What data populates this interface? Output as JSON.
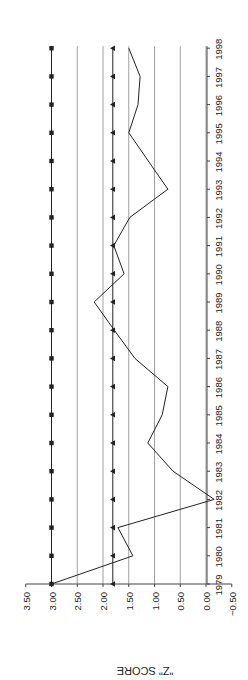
{
  "chart_data": {
    "type": "line",
    "orientation": "rotated-90-counterclockwise",
    "title": "",
    "xlabel": "",
    "ylabel": "\"Z\" SCORE",
    "ylim": [
      -0.5,
      3.5
    ],
    "yticks": [
      "3.50",
      "3.00",
      "2.50",
      "2.00",
      "1.50",
      "1.00",
      "0.50",
      "0.00",
      "-0.50"
    ],
    "ytick_values": [
      3.5,
      3.0,
      2.5,
      2.0,
      1.5,
      1.0,
      0.5,
      0.0,
      -0.5
    ],
    "gridlines": [
      3.0,
      2.5,
      2.0,
      1.5,
      1.0,
      0.5,
      0.0
    ],
    "grid": true,
    "legend": null,
    "categories": [
      "1979",
      "1980",
      "1981",
      "1982",
      "1983",
      "1984",
      "1985",
      "1986",
      "1987",
      "1988",
      "1989",
      "1990",
      "1991",
      "1992",
      "1993",
      "1994",
      "1995",
      "1996",
      "1997",
      "1998"
    ],
    "series": [
      {
        "name": "Z score",
        "marker": "none",
        "values": [
          3.0,
          1.42,
          1.71,
          -0.16,
          0.64,
          1.13,
          0.85,
          0.74,
          1.38,
          1.78,
          2.17,
          1.59,
          1.79,
          1.48,
          0.74,
          1.12,
          1.5,
          1.32,
          1.28,
          1.5
        ]
      },
      {
        "name": "Upper threshold",
        "marker": "square",
        "values": [
          3.0,
          3.0,
          3.0,
          3.0,
          3.0,
          3.0,
          3.0,
          3.0,
          3.0,
          3.0,
          3.0,
          3.0,
          3.0,
          3.0,
          3.0,
          3.0,
          3.0,
          3.0,
          3.0,
          3.0
        ]
      },
      {
        "name": "Lower threshold",
        "marker": "triangle",
        "values": [
          1.81,
          1.81,
          1.81,
          1.81,
          1.81,
          1.81,
          1.81,
          1.81,
          1.81,
          1.81,
          1.81,
          1.81,
          1.81,
          1.81,
          1.81,
          1.81,
          1.81,
          1.81,
          1.81,
          1.81
        ]
      }
    ]
  },
  "colors": {
    "line": "#222222",
    "grid": "#888888",
    "axis": "#444444"
  }
}
